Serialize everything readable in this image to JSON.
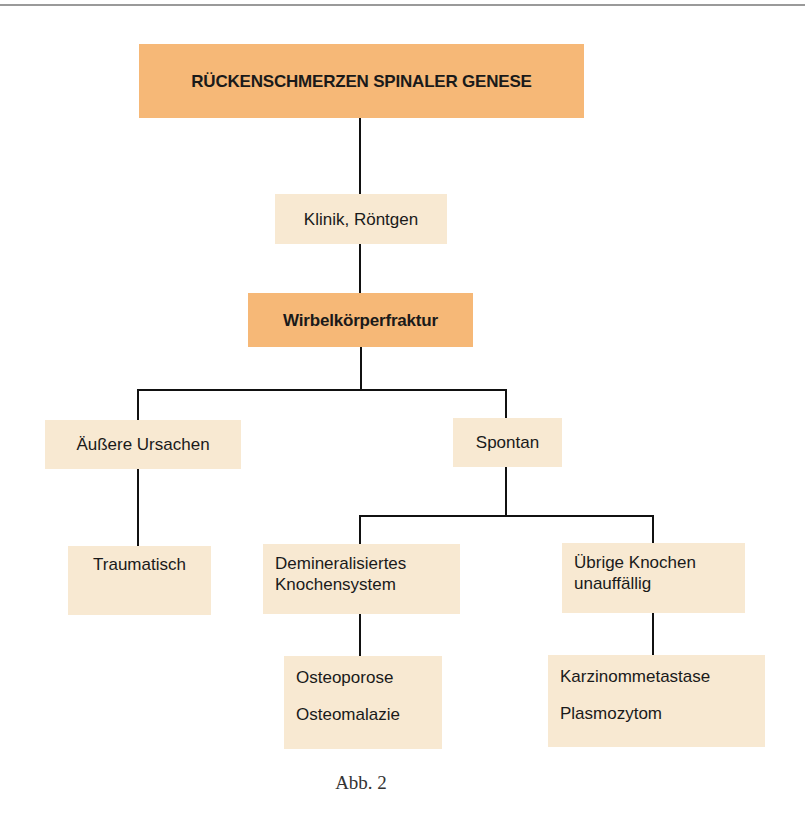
{
  "diagram": {
    "colors": {
      "primary_box": "#f6b877",
      "secondary_box": "#f8e9d2",
      "connector": "#111111"
    },
    "nodes": {
      "root": {
        "lines": [
          "RÜCKENSCHMERZEN SPINALER GENESE"
        ],
        "style": "primary"
      },
      "diagnostics": {
        "lines": [
          "Klinik, Röntgen"
        ],
        "style": "secondary"
      },
      "fracture": {
        "lines": [
          "Wirbelkörperfraktur"
        ],
        "style": "primary"
      },
      "external": {
        "lines": [
          "Äußere Ursachen"
        ],
        "style": "secondary"
      },
      "spontaneous": {
        "lines": [
          "Spontan"
        ],
        "style": "secondary"
      },
      "traumatic": {
        "lines": [
          "Traumatisch"
        ],
        "style": "secondary"
      },
      "demineralized": {
        "lines": [
          "Demineralisiertes",
          "Knochensystem"
        ],
        "style": "secondary"
      },
      "other_bones": {
        "lines": [
          "Übrige Knochen",
          "unauffällig"
        ],
        "style": "secondary"
      },
      "demineralized_causes": {
        "lines": [
          "Osteoporose",
          "Osteomalazie"
        ],
        "style": "secondary"
      },
      "other_causes": {
        "lines": [
          "Karzinommetastase",
          "Plasmozytom"
        ],
        "style": "secondary"
      }
    },
    "edges": [
      [
        "root",
        "diagnostics"
      ],
      [
        "diagnostics",
        "fracture"
      ],
      [
        "fracture",
        "external"
      ],
      [
        "fracture",
        "spontaneous"
      ],
      [
        "external",
        "traumatic"
      ],
      [
        "spontaneous",
        "demineralized"
      ],
      [
        "spontaneous",
        "other_bones"
      ],
      [
        "demineralized",
        "demineralized_causes"
      ],
      [
        "other_bones",
        "other_causes"
      ]
    ],
    "caption": "Abb. 2"
  }
}
